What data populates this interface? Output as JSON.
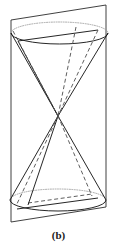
{
  "figure": {
    "caption": "(b)",
    "colors": {
      "background": "#ffffff",
      "solid_stroke": "#1a1a1a",
      "dashed_stroke": "#555555",
      "dotted_stroke": "#808080",
      "plane_stroke": "#2b2b2b",
      "caption_text": "#1a1a1a"
    },
    "geometry": {
      "apex": {
        "x": 58,
        "y": 116
      },
      "top_ellipse": {
        "cx": 59.5,
        "cy": 33,
        "rx": 48.5,
        "ry": 11
      },
      "bottom_ellipse": {
        "cx": 58,
        "cy": 200,
        "rx": 48,
        "ry": 11
      },
      "plane_corners": {
        "top_left": {
          "x": 11,
          "y": 20
        },
        "top_right": {
          "x": 106,
          "y": 5
        },
        "bottom_right": {
          "x": 106,
          "y": 207
        },
        "bottom_left": {
          "x": 11,
          "y": 222
        }
      },
      "upper_section_chord": {
        "left": {
          "x": 18,
          "y": 41
        },
        "right": {
          "x": 98,
          "y": 30
        }
      },
      "lower_section_chord": {
        "left": {
          "x": 17,
          "y": 209
        },
        "right": {
          "x": 98,
          "y": 198
        }
      }
    },
    "elements": {
      "upper_nappe": "upper cone nappe with elliptical rim",
      "lower_nappe": "lower cone nappe with elliptical rim",
      "cutting_plane": "slanted parallelogram plane",
      "hidden_edges": "dashed lines indicating hidden cone generators and plane intersection",
      "hidden_rim": "dotted lines indicating hidden portions of the elliptical rims"
    }
  }
}
